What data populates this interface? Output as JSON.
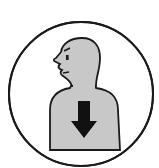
{
  "pictogram": {
    "label": "Person feeling down",
    "icon": "person-down-arrow-icon",
    "colors": {
      "background": "#ffffff",
      "outline": "#1a1a1a",
      "figure_fill": "#c8c8c8",
      "arrow": "#111111"
    }
  }
}
